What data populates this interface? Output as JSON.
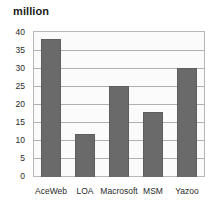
{
  "chart_data": {
    "type": "bar",
    "title": "million",
    "xlabel": "",
    "ylabel": "",
    "categories": [
      "AceWeb",
      "LOA",
      "Macrosoft",
      "MSM",
      "Yazoo"
    ],
    "values": [
      38,
      12,
      25,
      18,
      30
    ],
    "ylim": [
      0,
      40
    ],
    "yticks": [
      0,
      5,
      10,
      15,
      20,
      25,
      30,
      35,
      40
    ],
    "ytick_labels": [
      "0",
      "5",
      "10",
      "15",
      "20",
      "25",
      "30",
      "35",
      "40"
    ],
    "grid": true,
    "legend": false,
    "legend_position": "none",
    "bar_color": "#6a6a6a",
    "plot_background": "#fbfbfb",
    "gridline_color": "#b0b0b0",
    "frame_color": "#b8b8b8"
  }
}
